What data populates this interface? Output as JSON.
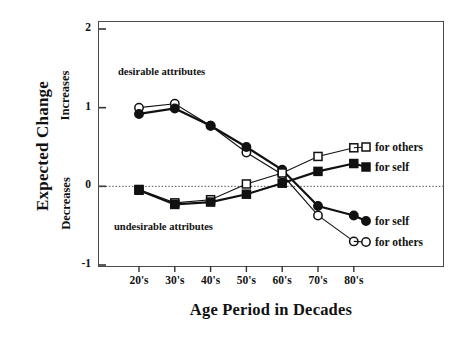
{
  "chart_data": {
    "type": "line",
    "title": "",
    "xlabel": "Age Period in Decades",
    "ylabel": "Expected Change",
    "ylabel_upper": "Increases",
    "ylabel_lower": "Decreases",
    "categories": [
      "20's",
      "30's",
      "40's",
      "50's",
      "60's",
      "70's",
      "80's"
    ],
    "ylim": [
      -1,
      2
    ],
    "yticks": [
      2,
      1,
      0,
      -1
    ],
    "ytick_labels": [
      "2",
      "1",
      "0",
      "-1"
    ],
    "grid": false,
    "zero_line": "dotted",
    "legend_position": "right-inside",
    "annotations": [
      {
        "text": "desirable attributes",
        "x": "30's",
        "y": 1.43
      },
      {
        "text": "undesirable attributes",
        "x": "30's",
        "y": -0.45
      }
    ],
    "series": [
      {
        "name": "desirable attributes, for others",
        "marker": "open-circle",
        "values": [
          1.0,
          1.05,
          0.77,
          0.43,
          0.15,
          -0.37,
          -0.7
        ],
        "legend": "for others"
      },
      {
        "name": "desirable attributes, for self",
        "marker": "filled-circle",
        "values": [
          0.92,
          0.99,
          0.77,
          0.5,
          0.21,
          -0.25,
          -0.37
        ],
        "legend": "for self"
      },
      {
        "name": "undesirable attributes, for others",
        "marker": "open-square",
        "values": [
          -0.04,
          -0.21,
          -0.17,
          0.03,
          0.17,
          0.38,
          0.49
        ],
        "legend": "for others"
      },
      {
        "name": "undesirable attributes, for self",
        "marker": "filled-square",
        "values": [
          -0.05,
          -0.23,
          -0.2,
          -0.1,
          0.04,
          0.19,
          0.29
        ],
        "legend": "for self"
      }
    ]
  },
  "axis": {
    "y_title": "Expected Change",
    "y_upper": "Increases",
    "y_lower": "Decreases",
    "x_title": "Age Period in Decades",
    "ytick_0": "2",
    "ytick_1": "1",
    "ytick_2": "0",
    "ytick_3": "-1",
    "xtick_0": "20's",
    "xtick_1": "30's",
    "xtick_2": "40's",
    "xtick_3": "50's",
    "xtick_4": "60's",
    "xtick_5": "70's",
    "xtick_6": "80's"
  },
  "annotations": {
    "desirable": "desirable attributes",
    "undesirable": "undesirable attributes"
  },
  "legend": {
    "top_others": "for others",
    "top_self": "for self",
    "bottom_self": "for self",
    "bottom_others": "for others"
  },
  "colors": {
    "ink": "#111111",
    "axis": "#444444",
    "background": "#ffffff"
  }
}
